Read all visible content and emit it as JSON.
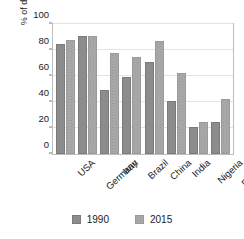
{
  "top_partial_text": "",
  "chart_data": {
    "type": "bar",
    "title": "",
    "subtitle": "",
    "xlabel": "",
    "ylabel": "% of deaths from NCDs",
    "ylim": [
      0,
      100
    ],
    "yticks": [
      0,
      20,
      40,
      60,
      80,
      100
    ],
    "grid": true,
    "legend_position": "bottom",
    "categories": [
      "USA",
      "Germany",
      "Iran",
      "Brazil",
      "China",
      "India",
      "Nigeria",
      "Ethiopia"
    ],
    "series": [
      {
        "name": "1990",
        "color": "#8c8c8c",
        "values": [
          85,
          91,
          49,
          59,
          71,
          41,
          21,
          25
        ]
      },
      {
        "name": "2015",
        "color": "#ababab",
        "values": [
          88,
          91,
          78,
          75,
          87,
          62,
          25,
          42
        ]
      }
    ]
  }
}
